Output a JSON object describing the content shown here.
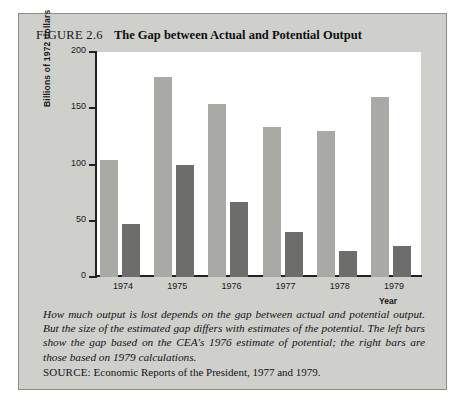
{
  "figure": {
    "number": "FIGURE 2.6",
    "title": "The Gap between Actual and Potential Output",
    "caption": "How much output is lost depends on the gap between actual and potential output.  But the size of the estimated gap differs with estimates of the potential.  The left bars show the gap based on the CEA's 1976 estimate of potential; the right bars are those based on 1979 calculations.",
    "source_label": "SOURCE:",
    "source_text": "Economic Reports of the President, 1977 and 1979."
  },
  "colors": {
    "bar_light": "#a9a9a6",
    "bar_dark": "#6d6d6c",
    "card": "#cfcfcb",
    "plot": "#ffffff",
    "axis": "#222226"
  },
  "chart_data": {
    "type": "bar",
    "title": "The Gap between Actual and Potential Output",
    "xlabel": "Year",
    "ylabel": "Billions of 1972 dollars",
    "categories": [
      "1974",
      "1975",
      "1976",
      "1977",
      "1978",
      "1979"
    ],
    "series": [
      {
        "name": "CEA's 1976 estimate of potential",
        "color": "#a9a9a6",
        "values": [
          104,
          178,
          154,
          133,
          130,
          160
        ]
      },
      {
        "name": "1979 calculations",
        "color": "#6d6d6c",
        "values": [
          47,
          100,
          67,
          40,
          23,
          28
        ]
      }
    ],
    "ylim": [
      0,
      200
    ],
    "yticks": [
      0,
      50,
      100,
      150,
      200
    ],
    "ytick_labels": [
      "0",
      "50",
      "100",
      "150",
      "200"
    ],
    "grid": false,
    "legend": "none"
  }
}
